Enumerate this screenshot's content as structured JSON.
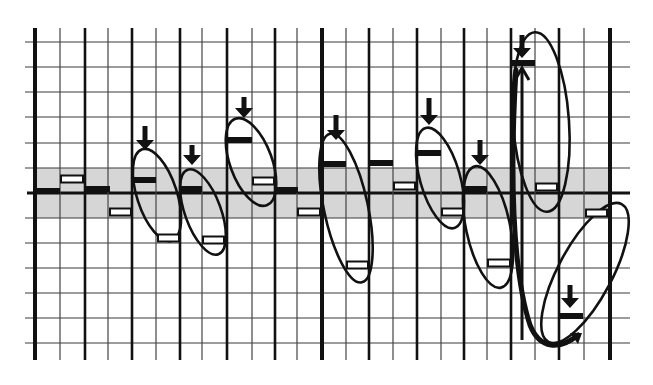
{
  "diagram": {
    "type": "hand-drawn grid diagram",
    "colors": {
      "background": "#ffffff",
      "ink": "#111111",
      "band": "#d6d6d6",
      "grid_thin": "#333333"
    },
    "grid": {
      "x_lines": [
        35,
        60,
        85,
        108,
        132,
        156,
        180,
        202,
        227,
        252,
        275,
        297,
        322,
        346,
        369,
        393,
        417,
        441,
        464,
        487,
        511,
        535,
        559,
        584,
        610
      ],
      "thick_x": [
        35,
        85,
        132,
        180,
        227,
        275,
        322,
        369,
        417,
        464,
        511,
        559,
        610
      ],
      "extra_thick_x": [
        35,
        322,
        610
      ],
      "y_lines": [
        42,
        67,
        92,
        117,
        143,
        168,
        193,
        218,
        243,
        268,
        293,
        318,
        343
      ],
      "axis_y": 193,
      "x_extent": [
        27,
        630
      ],
      "y_extent": [
        28,
        360
      ],
      "shaded_band": [
        168,
        218
      ]
    },
    "bars": [
      {
        "x1": 36,
        "x2": 60,
        "y": 191,
        "kind": "solid"
      },
      {
        "x1": 60,
        "x2": 84,
        "y": 179,
        "kind": "hollow"
      },
      {
        "x1": 86,
        "x2": 110,
        "y": 189,
        "kind": "solid"
      },
      {
        "x1": 109,
        "x2": 132,
        "y": 212,
        "kind": "hollow"
      },
      {
        "x1": 133,
        "x2": 156,
        "y": 180,
        "kind": "solid"
      },
      {
        "x1": 157,
        "x2": 180,
        "y": 238,
        "kind": "hollow"
      },
      {
        "x1": 181,
        "x2": 202,
        "y": 189,
        "kind": "solid"
      },
      {
        "x1": 202,
        "x2": 225,
        "y": 240,
        "kind": "hollow"
      },
      {
        "x1": 228,
        "x2": 252,
        "y": 140,
        "kind": "solid"
      },
      {
        "x1": 252,
        "x2": 275,
        "y": 181,
        "kind": "hollow"
      },
      {
        "x1": 276,
        "x2": 298,
        "y": 190,
        "kind": "solid"
      },
      {
        "x1": 297,
        "x2": 321,
        "y": 212,
        "kind": "hollow"
      },
      {
        "x1": 324,
        "x2": 346,
        "y": 164,
        "kind": "solid"
      },
      {
        "x1": 346,
        "x2": 369,
        "y": 265,
        "kind": "hollow"
      },
      {
        "x1": 370,
        "x2": 393,
        "y": 163,
        "kind": "solid"
      },
      {
        "x1": 393,
        "x2": 416,
        "y": 186,
        "kind": "hollow"
      },
      {
        "x1": 418,
        "x2": 441,
        "y": 153,
        "kind": "solid"
      },
      {
        "x1": 441,
        "x2": 464,
        "y": 212,
        "kind": "hollow"
      },
      {
        "x1": 465,
        "x2": 487,
        "y": 189,
        "kind": "solid"
      },
      {
        "x1": 487,
        "x2": 511,
        "y": 263,
        "kind": "hollow"
      },
      {
        "x1": 512,
        "x2": 535,
        "y": 63,
        "kind": "solid"
      },
      {
        "x1": 535,
        "x2": 558,
        "y": 187,
        "kind": "hollow"
      },
      {
        "x1": 585,
        "x2": 608,
        "y": 213,
        "kind": "hollow"
      },
      {
        "x1": 560,
        "x2": 583,
        "y": 316,
        "kind": "solid"
      }
    ],
    "down_arrows": [
      {
        "x": 145,
        "y1": 126,
        "y2": 150
      },
      {
        "x": 192,
        "y1": 145,
        "y2": 165
      },
      {
        "x": 244,
        "y1": 97,
        "y2": 118
      },
      {
        "x": 336,
        "y1": 115,
        "y2": 140
      },
      {
        "x": 429,
        "y1": 98,
        "y2": 125
      },
      {
        "x": 480,
        "y1": 140,
        "y2": 165
      },
      {
        "x": 522,
        "y1": 35,
        "y2": 58
      },
      {
        "x": 570,
        "y1": 285,
        "y2": 308
      }
    ],
    "up_arrows": [
      {
        "x": 522,
        "y1": 340,
        "y2": 68
      }
    ],
    "ovals": [
      {
        "cx": 157,
        "cy": 195,
        "rx": 20,
        "ry": 48,
        "rotate": -18
      },
      {
        "cx": 203,
        "cy": 212,
        "rx": 18,
        "ry": 45,
        "rotate": -20
      },
      {
        "cx": 251,
        "cy": 162,
        "rx": 21,
        "ry": 46,
        "rotate": -20
      },
      {
        "cx": 346,
        "cy": 208,
        "rx": 22,
        "ry": 76,
        "rotate": -12
      },
      {
        "cx": 440,
        "cy": 178,
        "rx": 20,
        "ry": 52,
        "rotate": -16
      },
      {
        "cx": 488,
        "cy": 227,
        "rx": 22,
        "ry": 62,
        "rotate": -12
      },
      {
        "cx": 541,
        "cy": 122,
        "rx": 28,
        "ry": 90,
        "rotate": -4
      },
      {
        "cx": 585,
        "cy": 273,
        "rx": 27,
        "ry": 78,
        "rotate": 28
      }
    ],
    "swoop_path": "M 516 70 C 510 170, 512 270, 530 325 C 540 350, 560 350, 578 335"
  }
}
